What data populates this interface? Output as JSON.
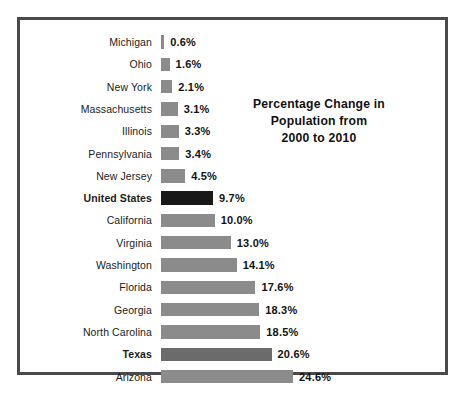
{
  "chart_data": {
    "type": "bar",
    "orientation": "horizontal",
    "title": "Percentage Change in Population from 2000 to 2010",
    "title_lines": [
      "Percentage Change in",
      "Population from",
      "2000 to 2010"
    ],
    "xlabel": "",
    "ylabel": "",
    "grid": false,
    "legend": "none",
    "xlim": [
      0,
      24.6
    ],
    "value_suffix": "%",
    "categories": [
      "Michigan",
      "Ohio",
      "New York",
      "Massachusetts",
      "Illinois",
      "Pennsylvania",
      "New Jersey",
      "United States",
      "California",
      "Virginia",
      "Washington",
      "Florida",
      "Georgia",
      "North Carolina",
      "Texas",
      "Arizona"
    ],
    "values": [
      0.6,
      1.6,
      2.1,
      3.1,
      3.3,
      3.4,
      4.5,
      9.7,
      10.0,
      13.0,
      14.1,
      17.6,
      18.3,
      18.5,
      20.6,
      24.6
    ],
    "value_labels": [
      "0.6%",
      "1.6%",
      "2.1%",
      "3.1%",
      "3.3%",
      "3.4%",
      "4.5%",
      "9.7%",
      "10.0%",
      "13.0%",
      "14.1%",
      "17.6%",
      "18.3%",
      "18.5%",
      "20.6%",
      "24.6%"
    ],
    "bar_styles": [
      "normal",
      "normal",
      "normal",
      "normal",
      "normal",
      "normal",
      "normal",
      "black",
      "normal",
      "normal",
      "normal",
      "normal",
      "normal",
      "normal",
      "dark",
      "normal"
    ],
    "emphasized": [
      false,
      false,
      false,
      false,
      false,
      false,
      false,
      true,
      false,
      false,
      false,
      false,
      false,
      false,
      true,
      false
    ]
  },
  "colors": {
    "bar_normal": "#8b8b8b",
    "bar_dark": "#6b6b6b",
    "bar_black": "#181818",
    "frame": "#4a4a4a",
    "background": "#ffffff",
    "text": "#1b1b1b"
  }
}
